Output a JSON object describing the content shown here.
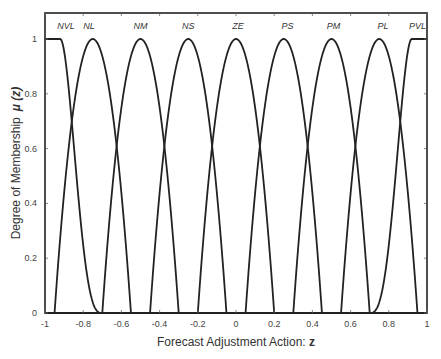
{
  "chart_data": {
    "type": "line",
    "title": "",
    "xlabel": "Forecast Adjustment Action: z",
    "xlabel_text": "Forecast Adjustment Action: ",
    "xlabel_var": "z",
    "ylabel": "Degree of Membership  μ (z)",
    "ylabel_text": "Degree of Membership",
    "ylabel_var": "μ (z)",
    "xlim": [
      -1,
      1
    ],
    "ylim": [
      0,
      1.08
    ],
    "xticks": [
      -1,
      -0.8,
      -0.6,
      -0.4,
      -0.2,
      0,
      0.2,
      0.4,
      0.6,
      0.8,
      1
    ],
    "xtick_labels": [
      "-1",
      "-0.8",
      "-0.6",
      "-0.4",
      "-0.2",
      "0",
      "0.2",
      "0.4",
      "0.6",
      "0.8",
      "1"
    ],
    "yticks": [
      0,
      0.2,
      0.4,
      0.6,
      0.8,
      1
    ],
    "ytick_labels": [
      "0",
      "0.2",
      "0.4",
      "0.6",
      "0.8",
      "1"
    ],
    "grid": false,
    "legend": "none",
    "series": [
      {
        "name": "NVL",
        "shape": "z-shaped",
        "plateau_end": -0.92,
        "zero_at": -0.7
      },
      {
        "name": "NL",
        "shape": "bell",
        "center": -0.75,
        "half_width": 0.2
      },
      {
        "name": "NM",
        "shape": "bell",
        "center": -0.5,
        "half_width": 0.2
      },
      {
        "name": "NS",
        "shape": "bell",
        "center": -0.25,
        "half_width": 0.2
      },
      {
        "name": "ZE",
        "shape": "bell",
        "center": 0.0,
        "half_width": 0.2
      },
      {
        "name": "PS",
        "shape": "bell",
        "center": 0.25,
        "half_width": 0.2
      },
      {
        "name": "PM",
        "shape": "bell",
        "center": 0.5,
        "half_width": 0.2
      },
      {
        "name": "PL",
        "shape": "bell",
        "center": 0.75,
        "half_width": 0.2
      },
      {
        "name": "PVL",
        "shape": "s-shaped",
        "zero_at": 0.7,
        "plateau_start": 0.92
      }
    ],
    "set_label_positions": [
      -0.89,
      -0.77,
      -0.5,
      -0.25,
      0.01,
      0.27,
      0.51,
      0.77,
      0.95
    ]
  }
}
